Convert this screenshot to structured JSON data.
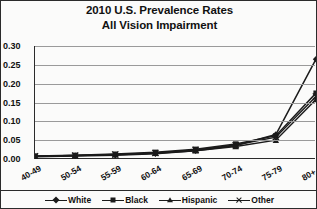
{
  "title": {
    "line1": "2010 U.S. Prevalence Rates",
    "line2": "All Vision Impairment"
  },
  "chart_data": {
    "type": "line",
    "title": "2010 U.S. Prevalence Rates All Vision Impairment",
    "xlabel": "",
    "ylabel": "",
    "categories": [
      "40-49",
      "50-54",
      "55-59",
      "60-64",
      "65-69",
      "70-74",
      "75-79",
      "80+"
    ],
    "ylim": [
      0.0,
      0.3
    ],
    "ytick_labels": [
      "0.00",
      "0.05",
      "0.10",
      "0.15",
      "0.20",
      "0.25",
      "0.30"
    ],
    "ytick_values": [
      0.0,
      0.05,
      0.1,
      0.15,
      0.2,
      0.25,
      0.3
    ],
    "grid": true,
    "legend_position": "bottom",
    "series": [
      {
        "name": "White",
        "marker": "diamond",
        "color": "#1b1b1b",
        "values": [
          0.006,
          0.008,
          0.01,
          0.014,
          0.022,
          0.036,
          0.065,
          0.265
        ]
      },
      {
        "name": "Black",
        "marker": "square",
        "color": "#1b1b1b",
        "values": [
          0.008,
          0.01,
          0.013,
          0.018,
          0.026,
          0.04,
          0.062,
          0.175
        ]
      },
      {
        "name": "Hispanic",
        "marker": "triangle",
        "color": "#1b1b1b",
        "values": [
          0.007,
          0.009,
          0.011,
          0.015,
          0.022,
          0.033,
          0.05,
          0.158
        ]
      },
      {
        "name": "Other",
        "marker": "cross",
        "color": "#1b1b1b",
        "values": [
          0.007,
          0.009,
          0.012,
          0.016,
          0.024,
          0.037,
          0.058,
          0.166
        ]
      }
    ]
  }
}
